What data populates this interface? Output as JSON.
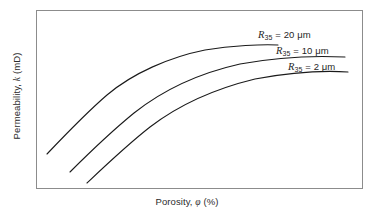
{
  "figure": {
    "background_color": "#ffffff",
    "frame_color": "#8c8c8c"
  },
  "axes": {
    "xlabel_prefix": "Porosity, ",
    "xlabel_symbol": "φ",
    "xlabel_suffix": " (%)",
    "xlabel_full": "Porosity, φ (%)",
    "ylabel_prefix": "Permeability, ",
    "ylabel_symbol": "k",
    "ylabel_suffix": " (mD)",
    "ylabel_full": "Permeability, k (mD)"
  },
  "labels": {
    "r20": {
      "symbol": "R",
      "subscript": "35",
      "text": " = 20 μm"
    },
    "r10": {
      "symbol": "R",
      "subscript": "35",
      "text": " = 10 μm"
    },
    "r2": {
      "symbol": "R",
      "subscript": "35",
      "text": " = 2 μm"
    }
  },
  "chart_data": {
    "type": "line",
    "title": "",
    "xlabel": "Porosity, φ (%)",
    "ylabel": "Permeability, k (mD)",
    "grid": false,
    "legend": "inline-curve-labels",
    "axis_ticks": "none",
    "schematic": true,
    "xlim": [
      0,
      100
    ],
    "ylim": [
      0,
      100
    ],
    "line_color": "#1a1a1a",
    "line_width": 1.1,
    "series": [
      {
        "name": "R35 = 20 μm",
        "label": "R35 = 20 μm",
        "r35_um": 20,
        "x": [
          3.4,
          12.0,
          21.0,
          30.0,
          39.0,
          48.0,
          57.0,
          66.0,
          74.0
        ],
        "y": [
          19.0,
          31.0,
          43.5,
          55.5,
          65.5,
          72.5,
          77.0,
          79.8,
          81.5
        ],
        "path": "M 47 154 C 66 134, 86 113, 107 95 C 133 73, 170 57, 205 50 C 232 45.5, 262 44.2, 278 45"
      },
      {
        "name": "R35 = 10 μm",
        "label": "R35 = 10 μm",
        "r35_um": 10,
        "x": [
          11.0,
          20.0,
          29.0,
          38.0,
          47.0,
          57.0,
          67.0,
          77.0,
          87.0,
          95.0
        ],
        "y": [
          9.0,
          20.0,
          31.5,
          42.5,
          52.5,
          60.5,
          66.0,
          69.5,
          71.3,
          72.3
        ],
        "path": "M 70 172 C 90 152, 112 131, 134 113 C 163 90, 200 73, 240 64 C 275 57.5, 315 55.5, 345 57"
      },
      {
        "name": "R35 = 2 μm",
        "label": "R35 = 2 μm",
        "r35_um": 2,
        "x": [
          16.5,
          25.0,
          34.0,
          43.0,
          52.0,
          62.0,
          72.0,
          82.0,
          91.0,
          96.0
        ],
        "y": [
          3.0,
          13.0,
          23.5,
          34.0,
          44.0,
          52.5,
          58.5,
          62.5,
          64.5,
          65.0
        ],
        "path": "M 87 183 C 106 165, 127 145, 150 127 C 180 104, 218 88, 255 79 C 290 72.5, 325 70.5, 348 72"
      }
    ]
  }
}
